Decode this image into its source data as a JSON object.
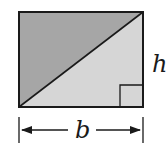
{
  "figure": {
    "labels": {
      "height": "h",
      "base": "b"
    },
    "colors": {
      "upper_triangle": "#a6a6a6",
      "lower_triangle": "#d6d6d6",
      "stroke": "#1a1a1a",
      "background": "#ffffff"
    }
  }
}
